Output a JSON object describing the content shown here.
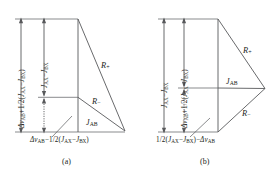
{
  "figure": {
    "type": "vector-diagram-pair",
    "stroke_color": "#58595b",
    "text_color": "#231f20",
    "background": "#ffffff"
  },
  "panels": [
    {
      "id": "a",
      "caption": "(a)",
      "vertical_labels": [
        {
          "name": "outer-span-label",
          "text": "ΔνAB+1/2(JAX−JBX)",
          "parts": {
            "delta": "Δ",
            "nu": "ν",
            "nu_sub": "AB",
            "op1": "+",
            "frac": "1/2(",
            "j1": "J",
            "j1_sub": "AX",
            "minus": "−",
            "j2": "J",
            "j2_sub": "BX",
            "close": ")"
          }
        },
        {
          "name": "inner-span-label",
          "text": "JAX−JBX",
          "parts": {
            "j1": "J",
            "j1_sub": "AX",
            "minus": "−",
            "j2": "J",
            "j2_sub": "BX"
          }
        }
      ],
      "bottom_label": {
        "name": "bottom-span-label",
        "text": "ΔνAB−1/2(JAX−JBX)",
        "parts": {
          "delta": "Δ",
          "nu": "ν",
          "nu_sub": "AB",
          "op1": "−",
          "frac": "1/2(",
          "j1": "J",
          "j1_sub": "AX",
          "minus": "−",
          "j2": "J",
          "j2_sub": "BX",
          "close": ")"
        }
      },
      "vectors": [
        {
          "name": "R-plus",
          "symbol": "R",
          "subscript": "+"
        },
        {
          "name": "R-minus",
          "symbol": "R",
          "subscript": "−"
        },
        {
          "name": "J-AB",
          "symbol": "J",
          "subscript": "AB"
        }
      ]
    },
    {
      "id": "b",
      "caption": "(b)",
      "vertical_labels": [
        {
          "name": "outer-span-label",
          "text": "JAX−JBX",
          "parts": {
            "j1": "J",
            "j1_sub": "AX",
            "minus": "−",
            "j2": "J",
            "j2_sub": "BX"
          }
        },
        {
          "name": "inner-span-label",
          "text": "ΔνAB+1/2(JAX−JBX)",
          "parts": {
            "delta": "Δ",
            "nu": "ν",
            "nu_sub": "AB",
            "op1": "+",
            "frac": "1/2(",
            "j1": "J",
            "j1_sub": "AX",
            "minus": "−",
            "j2": "J",
            "j2_sub": "BX",
            "close": ")"
          }
        }
      ],
      "bottom_label": {
        "name": "bottom-span-label",
        "text": "1/2(JAX−JBX)−ΔνAB",
        "parts": {
          "frac": "1/2(",
          "j1": "J",
          "j1_sub": "AX",
          "minus": "−",
          "j2": "J",
          "j2_sub": "BX",
          "close": ")",
          "op1": "−",
          "delta": "Δ",
          "nu": "ν",
          "nu_sub": "AB"
        }
      },
      "vectors": [
        {
          "name": "R-plus",
          "symbol": "R",
          "subscript": "+"
        },
        {
          "name": "R-minus",
          "symbol": "R",
          "subscript": "−"
        },
        {
          "name": "J-AB",
          "symbol": "J",
          "subscript": "AB"
        }
      ]
    }
  ]
}
